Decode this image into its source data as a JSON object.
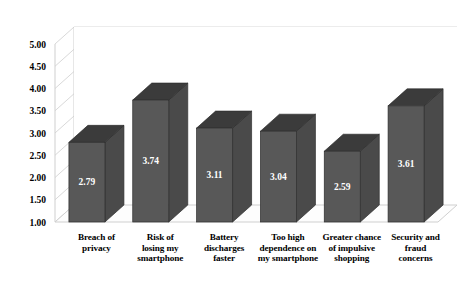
{
  "chart_data": {
    "type": "bar",
    "title": "",
    "subtitle": "",
    "xlabel": "",
    "ylabel": "",
    "categories": [
      "Breach of privacy",
      "Risk of losing my smartphone",
      "Battery discharges faster",
      "Too high dependence on my smartphone",
      "Greater chance of impulsive shopping",
      "Security and fraud concerns"
    ],
    "category_lines": [
      [
        "Breach of",
        "privacy"
      ],
      [
        "Risk of",
        "losing my",
        "smartphone"
      ],
      [
        "Battery",
        "discharges",
        "faster"
      ],
      [
        "Too high",
        "dependence on",
        "my smartphone"
      ],
      [
        "Greater chance",
        "of impulsive",
        "shopping"
      ],
      [
        "Security and",
        "fraud",
        "concerns"
      ]
    ],
    "values": [
      2.79,
      3.74,
      3.11,
      3.04,
      2.59,
      3.61
    ],
    "value_labels": [
      "2.79",
      "3.74",
      "3.11",
      "3.04",
      "2.59",
      "3.61"
    ],
    "ylim": [
      1.0,
      5.0
    ],
    "ytick_values": [
      5.0,
      4.5,
      4.0,
      3.5,
      3.0,
      2.5,
      2.0,
      1.5,
      1.0
    ],
    "ytick_labels": [
      "5.00",
      "4.50",
      "4.00",
      "3.50",
      "3.00",
      "2.50",
      "2.00",
      "1.50",
      "1.00"
    ],
    "grid": true,
    "legend": false,
    "legend_position": "none",
    "three_d": true,
    "colors": {
      "bar_front": "#585858",
      "bar_top": "#3b3b3b",
      "bar_side": "#4a4a4a",
      "bar_outline": "#2e2e2e",
      "gridline": "#d9d9d9",
      "wall_line": "#cfcfcf",
      "floor": "#fdfdfd",
      "value_label": "#ffffff",
      "tick_label": "#000000",
      "background": "#ffffff"
    }
  }
}
